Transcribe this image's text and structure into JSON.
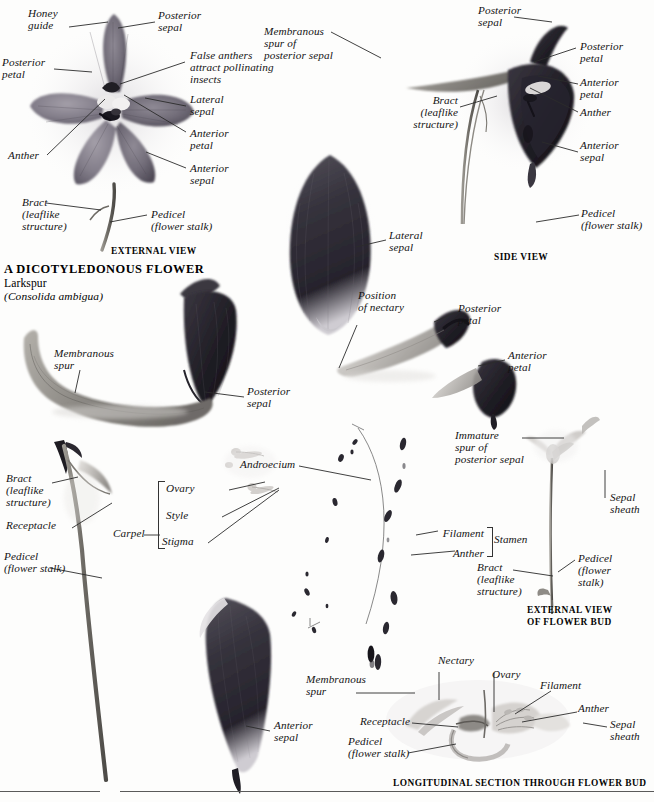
{
  "title": {
    "heading": "A DICOTYLEDONOUS FLOWER",
    "common_name": "Larkspur",
    "scientific_name": "(Consolida ambigua)"
  },
  "captions": {
    "external_view": "EXTERNAL VIEW",
    "side_view": "SIDE VIEW",
    "external_view_bud": "EXTERNAL VIEW\nOF FLOWER BUD",
    "longitudinal_section": "LONGITUDINAL SECTION THROUGH FLOWER BUD"
  },
  "external_view_labels": {
    "honey_guide": "Honey\nguide",
    "posterior_sepal": "Posterior\nsepal",
    "posterior_petal": "Posterior\npetal",
    "false_anthers": "False anthers\nattract pollinating\ninsects",
    "lateral_sepal": "Lateral\nsepal",
    "anterior_petal": "Anterior\npetal",
    "anterior_sepal": "Anterior\nsepal",
    "anther": "Anther",
    "bract": "Bract\n(leaflike\nstructure)",
    "pedicel": "Pedicel\n(flower stalk)"
  },
  "side_view_labels": {
    "membranous_spur": "Membranous\nspur of\nposterior sepal",
    "posterior_sepal": "Posterior\nsepal",
    "posterior_petal": "Posterior\npetal",
    "anterior_petal": "Anterior\npetal",
    "anther": "Anther",
    "anterior_sepal": "Anterior\nsepal",
    "bract": "Bract\n(leaflike\nstructure)",
    "pedicel": "Pedicel\n(flower stalk)"
  },
  "dissection_labels": {
    "lateral_sepal": "Lateral\nsepal",
    "position_of_nectary": "Position\nof nectary",
    "posterior_petal": "Posterior\npetal",
    "anterior_petal": "Anterior\npetal",
    "membranous_spur": "Membranous\nspur",
    "posterior_sepal": "Posterior\nsepal",
    "bract": "Bract\n(leaflike\nstructure)",
    "receptacle": "Receptacle",
    "pedicel": "Pedicel\n(flower stalk)",
    "androecium": "Androecium",
    "carpel": "Carpel",
    "ovary": "Ovary",
    "style": "Style",
    "stigma": "Stigma",
    "anterior_sepal": "Anterior\nsepal"
  },
  "bud_labels": {
    "immature_spur": "Immature\nspur of\nposterior sepal",
    "sepal_sheath": "Sepal\nsheath",
    "filament": "Filament",
    "anther": "Anther",
    "stamen": "Stamen",
    "bract": "Bract\n(leaflike\nstructure)",
    "pedicel": "Pedicel\n(flower\nstalk)"
  },
  "section_labels": {
    "nectary": "Nectary",
    "ovary": "Ovary",
    "filament": "Filament",
    "anther": "Anther",
    "sepal_sheath": "Sepal\nsheath",
    "membranous_spur": "Membranous\nspur",
    "receptacle": "Receptacle",
    "pedicel": "Pedicel\n(flower stalk)"
  },
  "colors": {
    "petal_dark": "#2f2b33",
    "petal_mid": "#6b6570",
    "petal_light": "#a9a4ad",
    "stem": "#7c7a74",
    "page": "#fdfdfc",
    "leader": "#2b2b2b",
    "text": "#141414"
  }
}
